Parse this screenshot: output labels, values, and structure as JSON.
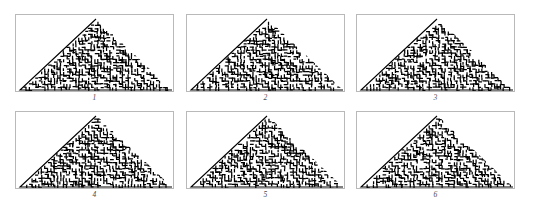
{
  "figure": {
    "layout": {
      "rows": 2,
      "cols": 3,
      "panel_count": 6
    },
    "colors": {
      "background": "#ffffff",
      "panel_border": "#b9b9b9",
      "pattern_ink": "#000000",
      "caption": "#4a4a4a"
    },
    "panels": [
      {
        "caption": "1",
        "seed": 11
      },
      {
        "caption": "2",
        "seed": 27
      },
      {
        "caption": "3",
        "seed": 43
      },
      {
        "caption": "4",
        "seed": 59
      },
      {
        "caption": "5",
        "seed": 71
      },
      {
        "caption": "6",
        "seed": 97
      }
    ]
  }
}
